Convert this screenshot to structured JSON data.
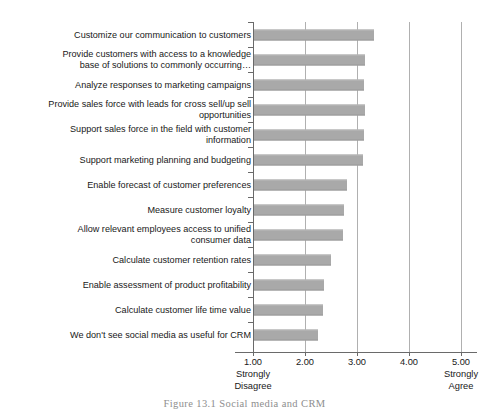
{
  "caption": "Figure 13.1  Social media and CRM",
  "chart_data": {
    "type": "bar",
    "orientation": "horizontal",
    "title": "",
    "xlabel": "",
    "ylabel": "",
    "xlim": [
      1.0,
      5.0
    ],
    "grid": true,
    "legend": "none",
    "bar_color": "#a9a9a9",
    "axis_color": "#6a6a6a",
    "gridline_color": "#b0b0b0",
    "xticks": [
      "1.00",
      "2.00",
      "3.00",
      "4.00",
      "5.00"
    ],
    "xtick_values": [
      1,
      2,
      3,
      4,
      5
    ],
    "scale_anchor_low": "Strongly\nDisagree",
    "scale_anchor_high": "Strongly\nAgree",
    "categories": [
      "Customize our communication to customers",
      "Provide customers with access to a knowledge\nbase of solutions to commonly occurring…",
      "Analyze responses to marketing campaigns",
      "Provide sales force with leads for cross sell/up sell\nopportunities",
      "Support sales force in the field with customer\ninformation",
      "Support marketing planning and budgeting",
      "Enable forecast of customer preferences",
      "Measure customer loyalty",
      "Allow relevant employees access to unified\nconsumer data",
      "Calculate customer retention rates",
      "Enable assessment of product profitability",
      "Calculate customer life time value",
      "We don't see social media as useful for CRM"
    ],
    "values": [
      3.3,
      3.12,
      3.1,
      3.12,
      3.1,
      3.08,
      2.78,
      2.72,
      2.7,
      2.47,
      2.34,
      2.33,
      2.23
    ]
  }
}
